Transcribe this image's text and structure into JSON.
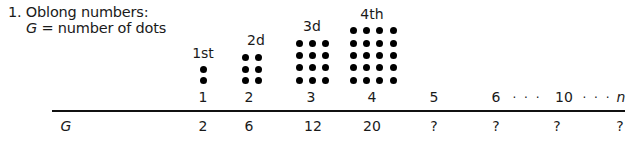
{
  "problem": {
    "title": "1. Oblong numbers:",
    "subtitle_var": "G",
    "subtitle_rest": " = number of dots"
  },
  "figures": [
    {
      "label": "1st",
      "cols": 1,
      "rows": 2
    },
    {
      "label": "2d",
      "cols": 2,
      "rows": 3
    },
    {
      "label": "3d",
      "cols": 3,
      "rows": 4
    },
    {
      "label": "4th",
      "cols": 4,
      "rows": 5
    }
  ],
  "table": {
    "header_row": [
      "1",
      "2",
      "3",
      "4",
      "5",
      "6",
      "10",
      "n"
    ],
    "ellipsis": "· · ·",
    "row_label": "G",
    "values": [
      "2",
      "6",
      "12",
      "20",
      "?",
      "?",
      "?",
      "?"
    ]
  }
}
